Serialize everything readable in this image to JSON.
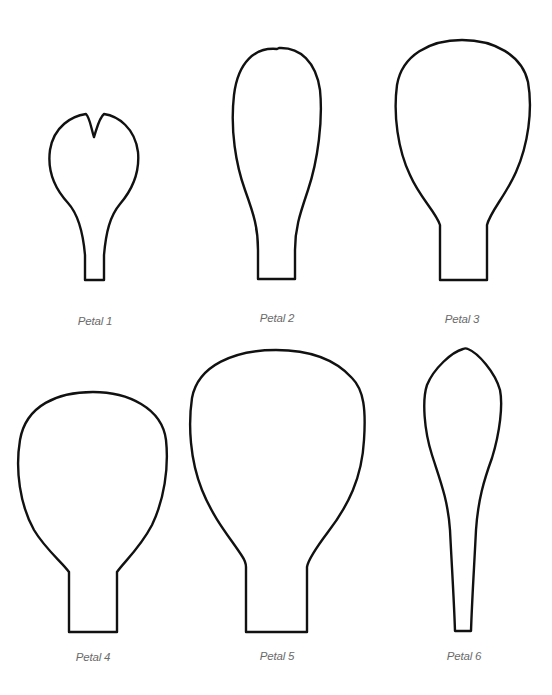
{
  "petals": [
    {
      "label": "Petal 1"
    },
    {
      "label": "Petal 2"
    },
    {
      "label": "Petal 3"
    },
    {
      "label": "Petal 4"
    },
    {
      "label": "Petal 5"
    },
    {
      "label": "Petal 6"
    }
  ],
  "colors": {
    "outline": "#111111",
    "label": "#6a6a6a",
    "background": "#ffffff"
  }
}
